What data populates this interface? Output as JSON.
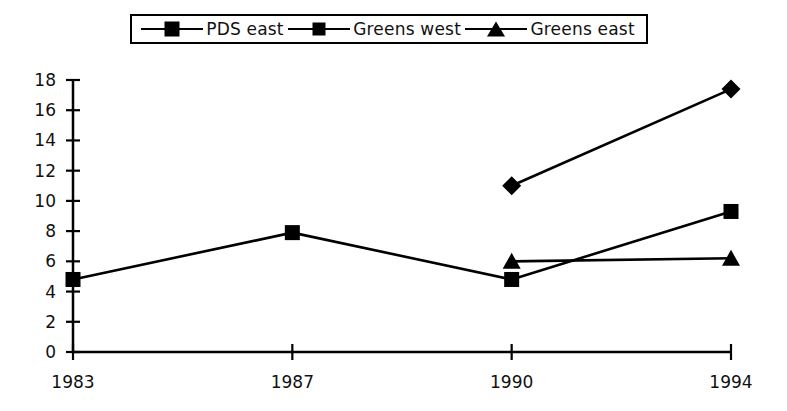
{
  "chart_data": {
    "type": "line",
    "title": "",
    "xlabel": "",
    "ylabel": "",
    "categories": [
      "1983",
      "1987",
      "1990",
      "1994"
    ],
    "ylim": [
      0,
      18
    ],
    "yticks": [
      0,
      2,
      4,
      6,
      8,
      10,
      12,
      14,
      16,
      18
    ],
    "grid": false,
    "legend_position": "top",
    "series": [
      {
        "name": "PDS east",
        "marker": "diamond",
        "values": [
          null,
          null,
          11.0,
          17.4
        ]
      },
      {
        "name": "Greens west",
        "marker": "square",
        "values": [
          4.8,
          7.9,
          4.8,
          9.3
        ]
      },
      {
        "name": "Greens east",
        "marker": "triangle",
        "values": [
          null,
          null,
          6.0,
          6.2
        ]
      }
    ],
    "colors": {
      "line": "#000000",
      "marker": "#000000",
      "axis": "#000000",
      "background": "#ffffff"
    }
  },
  "legend": {
    "entries": [
      {
        "label": "PDS east",
        "marker": "diamond-marker-icon"
      },
      {
        "label": "Greens west",
        "marker": "square-marker-icon"
      },
      {
        "label": "Greens east",
        "marker": "triangle-marker-icon"
      }
    ]
  }
}
